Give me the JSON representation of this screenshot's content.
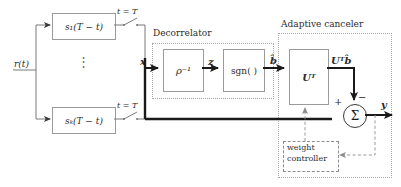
{
  "diagram": {
    "input_label": "r(t)",
    "output_label": "y",
    "matched_filters": [
      {
        "id": "mf1",
        "label": "s₁(T − t)",
        "switch_label": "t = T"
      },
      {
        "id": "mfk",
        "label": "sₖ(T − t)",
        "switch_label": "t = T"
      }
    ],
    "ellipsis": "⋮",
    "groups": [
      {
        "id": "decorrelator",
        "label": "Decorrelator"
      },
      {
        "id": "adaptive-canceler",
        "label": "Adaptive canceler"
      }
    ],
    "blocks": [
      {
        "id": "rho-inverse",
        "label": "ρ⁻¹"
      },
      {
        "id": "sgn",
        "label": "sgn( )"
      },
      {
        "id": "u-transpose",
        "label": "Uᵀ"
      },
      {
        "id": "weight-controller",
        "line1": "weight",
        "line2": "controller"
      }
    ],
    "signals": [
      {
        "id": "x",
        "label": "x"
      },
      {
        "id": "z",
        "label": "z"
      },
      {
        "id": "b-hat",
        "label": "b̂"
      },
      {
        "id": "utb",
        "label": "Uᵀb̂"
      }
    ],
    "summer": {
      "id": "summing-junction",
      "symbol": "Σ",
      "plus_sign": "+",
      "minus_sign": "−"
    },
    "colors": {
      "line": "#3a3a3a",
      "box_border": "#9a9a9a",
      "dotted_group": "#a8a8a8",
      "dashed_feedback": "#8d8d8d",
      "text": "#2b2b2b",
      "background": "#ffffff"
    }
  }
}
